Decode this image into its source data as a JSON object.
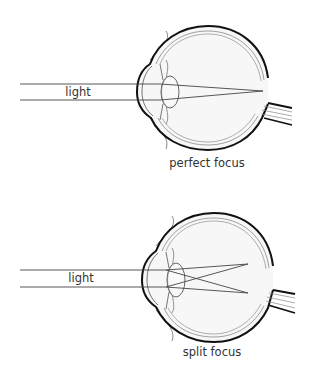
{
  "diagrams": [
    {
      "id": "top",
      "light_label": "light",
      "caption": "perfect focus"
    },
    {
      "id": "bottom",
      "light_label": "light",
      "caption": "split focus"
    }
  ],
  "colors": {
    "stroke_dark": "#111111",
    "stroke_light": "#777777",
    "eye_fill": "#f6f6f6",
    "text": "#333333"
  }
}
